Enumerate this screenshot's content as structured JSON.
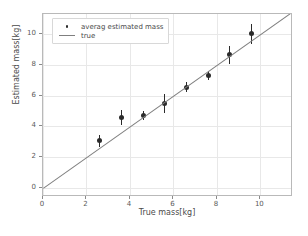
{
  "chart_data": {
    "type": "scatter",
    "title": "",
    "xlabel": "True mass[kg]",
    "ylabel": "Estimated mass[kg]",
    "xlim": [
      0,
      11.5
    ],
    "ylim": [
      -0.6,
      11.3
    ],
    "xticks": [
      "0",
      "2",
      "4",
      "6",
      "8",
      "10"
    ],
    "xtick_values": [
      0,
      2,
      4,
      6,
      8,
      10
    ],
    "yticks": [
      "0",
      "2",
      "4",
      "6",
      "8",
      "10"
    ],
    "ytick_values": [
      0,
      2,
      4,
      6,
      8,
      10
    ],
    "grid": true,
    "legend_position": "upper left",
    "series": [
      {
        "name": "averag estimated mass",
        "type": "scatter-errorbar",
        "marker": "circle",
        "color": "#2b2b2b",
        "x": [
          2.6,
          3.6,
          4.6,
          5.6,
          6.6,
          7.6,
          8.6,
          9.6
        ],
        "y": [
          3.05,
          4.55,
          4.7,
          5.45,
          6.55,
          7.3,
          8.65,
          10.0
        ],
        "yerr": [
          0.38,
          0.48,
          0.3,
          0.62,
          0.35,
          0.28,
          0.58,
          0.62
        ]
      },
      {
        "name": "true",
        "type": "line",
        "color": "#7f7f7f",
        "x": [
          0,
          11.5
        ],
        "y": [
          0,
          11.5
        ]
      }
    ]
  },
  "legend": {
    "entries": [
      {
        "label": "averag estimated mass",
        "key": "marker"
      },
      {
        "label": "true",
        "key": "line"
      }
    ]
  }
}
